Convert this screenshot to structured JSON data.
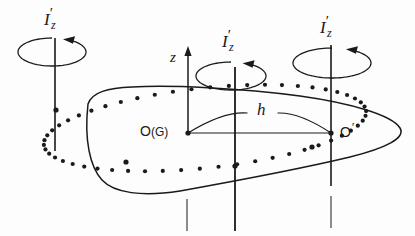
{
  "figure": {
    "background_color": "#fdfdfd",
    "stroke_color": "#1a1a1a"
  },
  "labels": {
    "inertia_left": {
      "symbol": "I",
      "prime": "′",
      "subscript": "z",
      "x": 44,
      "y": 6
    },
    "inertia_middle": {
      "symbol": "I",
      "prime": "′",
      "subscript": "z",
      "x": 222,
      "y": 28
    },
    "inertia_right": {
      "symbol": "I",
      "prime": "′",
      "subscript": "z",
      "x": 320,
      "y": 14
    },
    "z_axis": {
      "text": "z",
      "x": 170,
      "y": 50
    },
    "distance": {
      "text": "h",
      "x": 257,
      "y": 101
    },
    "origin": {
      "text": "O",
      "paren": "(G)",
      "x": 140,
      "y": 124
    },
    "origin_prime": {
      "text": "O",
      "prime": "′",
      "x": 340,
      "y": 120
    }
  },
  "geometry": {
    "axes": [
      {
        "name": "left-axis",
        "x": 55,
        "y1": 38,
        "y2": 151,
        "width": 1.6
      },
      {
        "name": "center-axis",
        "x": 235,
        "y1": 67,
        "y2": 231,
        "width": 1.8
      },
      {
        "name": "right-axis",
        "x": 331,
        "y1": 45,
        "y2": 186,
        "width": 1.6
      },
      {
        "name": "z-axis",
        "x": 188,
        "y1": 52,
        "y2": 133,
        "width": 1.5
      },
      {
        "name": "left-stub",
        "x": 187,
        "y1": 199,
        "y2": 231,
        "width": 1.0
      },
      {
        "name": "right-stub",
        "x": 331,
        "y1": 196,
        "y2": 228,
        "width": 1.0
      }
    ],
    "rotation_arrows": [
      {
        "name": "rotation-left",
        "cx": 52,
        "cy": 52,
        "rx": 34,
        "ry": 14
      },
      {
        "name": "rotation-middle",
        "cx": 231,
        "cy": 76,
        "rx": 35,
        "ry": 14
      },
      {
        "name": "rotation-right",
        "cx": 332,
        "cy": 63,
        "rx": 39,
        "ry": 15
      }
    ],
    "dotted_ellipse": {
      "cx": 205,
      "cy": 128,
      "rx": 162,
      "ry": 40,
      "rotation": -6,
      "dot_radius": 2.1,
      "dot_count": 54
    },
    "marker_points": [
      {
        "name": "point-left-axis",
        "x": 56,
        "y": 110
      },
      {
        "name": "point-origin",
        "x": 188,
        "y": 133
      },
      {
        "name": "point-origin-prime",
        "x": 331,
        "y": 133
      },
      {
        "name": "point-center-axis-front",
        "x": 235,
        "y": 166
      },
      {
        "name": "point-blob-front",
        "x": 126,
        "y": 162
      },
      {
        "name": "point-right-front",
        "x": 312,
        "y": 147
      }
    ],
    "distance_lens": {
      "x1": 188,
      "y1": 133,
      "x2": 331,
      "y2": 133,
      "arc_height": 22
    },
    "plane_outline": "M 88 104 C 92 92 108 88 132 87 C 170 85 240 88 300 96 C 350 103 392 115 400 128 C 406 138 386 148 350 157 C 300 169 230 182 180 191 C 142 197 114 193 102 180 C 90 167 84 140 88 104 Z"
  },
  "icons": {
    "rotation_arrowhead": "arrow-counterclockwise-icon",
    "z_axis_arrowhead": "arrow-up-icon"
  }
}
